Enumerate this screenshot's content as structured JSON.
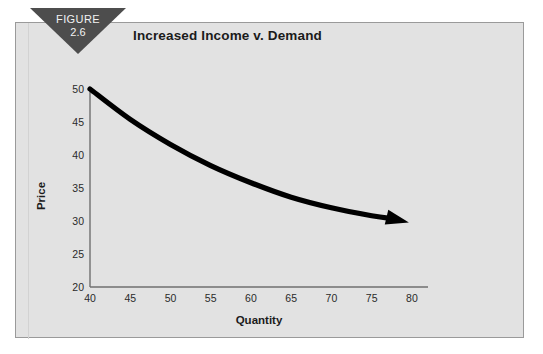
{
  "figure": {
    "tag_label": "FIGURE",
    "tag_number": "2.6"
  },
  "chart_data": {
    "type": "line",
    "title": "Increased Income v. Demand",
    "xlabel": "Quantity",
    "ylabel": "Price",
    "xlim": [
      40,
      82
    ],
    "ylim": [
      20,
      50
    ],
    "xticks": [
      40,
      45,
      50,
      55,
      60,
      65,
      70,
      75,
      80
    ],
    "xtick_labels": [
      "40",
      "45",
      "50",
      "55",
      "60",
      "65",
      "70",
      "75",
      "80"
    ],
    "yticks": [
      20,
      25,
      30,
      35,
      40,
      45,
      50
    ],
    "ytick_labels": [
      "20",
      "25",
      "30",
      "35",
      "40",
      "45",
      "50"
    ],
    "grid": false,
    "legend": null,
    "series": [
      {
        "name": "Demand curve",
        "style": "thick-tapered-arrow",
        "color": "#000000",
        "arrow_head": "end",
        "x": [
          40,
          45,
          50,
          55,
          60,
          65,
          70,
          75,
          80
        ],
        "y": [
          50,
          45.4,
          41.6,
          38.4,
          35.8,
          33.6,
          32.0,
          30.8,
          30.0
        ]
      }
    ],
    "axis_color": "#6f6f6f",
    "plot_background": "#e2e2e2"
  },
  "colors": {
    "panel_background": "#e2e2e2",
    "panel_border": "#9a9a9a",
    "tag_background": "#4d4d4d",
    "tag_text": "#f2f2f2",
    "curve": "#000000",
    "text": "#1b1b1b"
  }
}
